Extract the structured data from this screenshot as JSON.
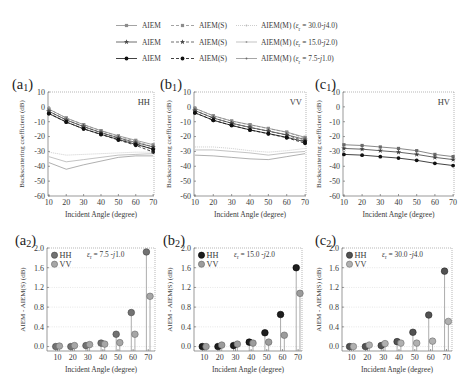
{
  "legend": {
    "rows": [
      [
        {
          "label": "AIEM",
          "line": "solid",
          "marker": "square",
          "color": "#8c8c8c"
        },
        {
          "label": "AIEM(S)",
          "line": "dashed",
          "marker": "square",
          "color": "#8c8c8c"
        },
        {
          "label": "AIEM(M) (*ε*_r = 30.0-*j*4.0)",
          "line": "dotted",
          "marker": "dot",
          "color": "#b8b8b8"
        }
      ],
      [
        {
          "label": "AIEM",
          "line": "solid",
          "marker": "star",
          "color": "#4a4a4a"
        },
        {
          "label": "AIEM(S)",
          "line": "dashed",
          "marker": "star",
          "color": "#4a4a4a"
        },
        {
          "label": "AIEM(M) (*ε*_r = 15.0-*j*2.0)",
          "line": "thin",
          "marker": "dot",
          "color": "#9a9a9a"
        }
      ],
      [
        {
          "label": "AIEM",
          "line": "solid",
          "marker": "circle",
          "color": "#111111"
        },
        {
          "label": "AIEM(S)",
          "line": "dashed",
          "marker": "circle",
          "color": "#111111"
        },
        {
          "label": "AIEM(M) (*ε*_r = 7.5-*j*1.0)",
          "line": "thin",
          "marker": "dot",
          "color": "#6a6a6a"
        }
      ]
    ]
  },
  "chart_data": [
    {
      "type": "line",
      "panel_label": "(a_1)",
      "polarization_label": "HH",
      "xlabel": "Incident  Angle (degree)",
      "ylabel": "Backscattering coefficient (dB)",
      "x": [
        10,
        20,
        30,
        40,
        50,
        60,
        70
      ],
      "xlim": [
        9.5,
        70.5
      ],
      "ylim": [
        -60,
        10
      ],
      "xticks": [
        10,
        20,
        30,
        40,
        50,
        60,
        70
      ],
      "xtick_labels": [
        "10",
        "20",
        "30",
        "40",
        "50",
        "60",
        "70"
      ],
      "yticks": [
        10,
        0,
        -10,
        -20,
        -30,
        -40,
        -50,
        -60
      ],
      "ytick_labels": [
        "10",
        "0",
        "-10",
        "-20",
        "-30",
        "-40",
        "-50",
        "-60"
      ],
      "grid": false,
      "series": [
        {
          "name": "AIEM (εr = 30.0-j4.0)",
          "line": "solid",
          "marker": "square",
          "color": "#8c8c8c",
          "values": [
            -1.5,
            -7.5,
            -12.0,
            -16.0,
            -19.5,
            -22.5,
            -25.5
          ]
        },
        {
          "name": "AIEM(S) (εr = 30.0-j4.0)",
          "line": "dashed",
          "marker": "square",
          "color": "#8c8c8c",
          "values": [
            -1.5,
            -7.5,
            -12.0,
            -16.1,
            -19.8,
            -23.1,
            -27.0
          ]
        },
        {
          "name": "AIEM (εr = 15.0-j2.0)",
          "line": "solid",
          "marker": "star",
          "color": "#4a4a4a",
          "values": [
            -3.0,
            -8.8,
            -13.3,
            -17.3,
            -20.8,
            -24.0,
            -27.0
          ]
        },
        {
          "name": "AIEM(S) (εr = 15.0-j2.0)",
          "line": "dashed",
          "marker": "star",
          "color": "#4a4a4a",
          "values": [
            -3.0,
            -8.8,
            -13.3,
            -17.4,
            -21.1,
            -24.7,
            -28.6
          ]
        },
        {
          "name": "AIEM (εr = 7.5-j1.0)",
          "line": "solid",
          "marker": "circle",
          "color": "#111111",
          "values": [
            -4.5,
            -10.2,
            -14.8,
            -18.5,
            -22.0,
            -25.2,
            -28.5
          ]
        },
        {
          "name": "AIEM(S) (εr = 7.5-j1.0)",
          "line": "dashed",
          "marker": "circle",
          "color": "#111111",
          "values": [
            -4.5,
            -10.2,
            -14.8,
            -18.6,
            -22.3,
            -25.9,
            -30.4
          ]
        },
        {
          "name": "AIEM(M) (εr = 30.0-j4.0)",
          "line": "dotted",
          "marker": "none",
          "color": "#b8b8b8",
          "values": [
            -30.5,
            -32.5,
            -32.0,
            -31.5,
            -31.0,
            -30.5,
            -30.5
          ]
        },
        {
          "name": "AIEM(M) (εr = 15.0-j2.0)",
          "line": "thin",
          "marker": "none",
          "color": "#9a9a9a",
          "values": [
            -33.5,
            -37.0,
            -35.5,
            -34.0,
            -32.5,
            -32.0,
            -31.5
          ]
        },
        {
          "name": "AIEM(M) (εr = 7.5-j1.0)",
          "line": "thin",
          "marker": "none",
          "color": "#7a7a7a",
          "values": [
            -37.5,
            -42.0,
            -39.0,
            -36.5,
            -34.0,
            -33.0,
            -33.0
          ]
        }
      ]
    },
    {
      "type": "line",
      "panel_label": "(b_1)",
      "polarization_label": "VV",
      "xlabel": "Incident  Angle (degree)",
      "ylabel": "Backscattering coefficient (dB)",
      "x": [
        10,
        20,
        30,
        40,
        50,
        60,
        70
      ],
      "xlim": [
        9.5,
        70.5
      ],
      "ylim": [
        -60,
        10
      ],
      "xticks": [
        10,
        20,
        30,
        40,
        50,
        60,
        70
      ],
      "xtick_labels": [
        "10",
        "20",
        "30",
        "40",
        "50",
        "60",
        "70"
      ],
      "yticks": [
        10,
        0,
        -10,
        -20,
        -30,
        -40,
        -50,
        -60
      ],
      "ytick_labels": [
        "10",
        "0",
        "-10",
        "-20",
        "-30",
        "-40",
        "-50",
        "-60"
      ],
      "grid": false,
      "series": [
        {
          "name": "AIEM (εr = 30.0-j4.0)",
          "line": "solid",
          "marker": "square",
          "color": "#8c8c8c",
          "values": [
            -1.0,
            -6.0,
            -9.5,
            -12.0,
            -14.5,
            -17.0,
            -20.5
          ]
        },
        {
          "name": "AIEM(S) (εr = 30.0-j4.0)",
          "line": "dashed",
          "marker": "square",
          "color": "#8c8c8c",
          "values": [
            -1.0,
            -6.0,
            -9.6,
            -12.1,
            -14.6,
            -17.1,
            -21.0
          ]
        },
        {
          "name": "AIEM (εr = 15.0-j2.0)",
          "line": "solid",
          "marker": "star",
          "color": "#4a4a4a",
          "values": [
            -2.5,
            -7.5,
            -11.0,
            -13.8,
            -16.3,
            -18.8,
            -22.0
          ]
        },
        {
          "name": "AIEM(S) (εr = 15.0-j2.0)",
          "line": "dashed",
          "marker": "star",
          "color": "#4a4a4a",
          "values": [
            -2.5,
            -7.5,
            -11.1,
            -13.9,
            -16.4,
            -19.0,
            -23.1
          ]
        },
        {
          "name": "AIEM (εr = 7.5-j1.0)",
          "line": "solid",
          "marker": "circle",
          "color": "#111111",
          "values": [
            -4.0,
            -9.0,
            -12.5,
            -15.5,
            -18.0,
            -20.5,
            -23.5
          ]
        },
        {
          "name": "AIEM(S) (εr = 7.5-j1.0)",
          "line": "dashed",
          "marker": "circle",
          "color": "#111111",
          "values": [
            -4.0,
            -9.0,
            -12.5,
            -15.6,
            -18.1,
            -20.8,
            -24.5
          ]
        },
        {
          "name": "AIEM(M) (εr = 30.0-j4.0)",
          "line": "dotted",
          "marker": "none",
          "color": "#b8b8b8",
          "values": [
            -27.0,
            -27.0,
            -28.0,
            -29.5,
            -30.5,
            -29.5,
            -28.0
          ]
        },
        {
          "name": "AIEM(M) (εr = 15.0-j2.0)",
          "line": "thin",
          "marker": "none",
          "color": "#9a9a9a",
          "values": [
            -29.0,
            -29.0,
            -30.0,
            -31.0,
            -32.5,
            -31.0,
            -30.0
          ]
        },
        {
          "name": "AIEM(M) (εr = 7.5-j1.0)",
          "line": "thin",
          "marker": "none",
          "color": "#7a7a7a",
          "values": [
            -32.5,
            -33.0,
            -34.0,
            -35.0,
            -35.5,
            -33.5,
            -31.5
          ]
        }
      ]
    },
    {
      "type": "line",
      "panel_label": "(c_1)",
      "polarization_label": "HV",
      "xlabel": "Incident  Angle (degree)",
      "ylabel": "Backscattering coefficient (dB)",
      "x": [
        10,
        20,
        30,
        40,
        50,
        60,
        70
      ],
      "xlim": [
        9.5,
        70.5
      ],
      "ylim": [
        -60,
        10
      ],
      "xticks": [
        10,
        20,
        30,
        40,
        50,
        60,
        70
      ],
      "xtick_labels": [
        "10",
        "20",
        "30",
        "40",
        "50",
        "60",
        "70"
      ],
      "yticks": [
        10,
        0,
        -10,
        -20,
        -30,
        -40,
        -50,
        -60
      ],
      "ytick_labels": [
        "10",
        "0",
        "-10",
        "-20",
        "-30",
        "-40",
        "-50",
        "-60"
      ],
      "grid": false,
      "series": [
        {
          "name": "AIEM (εr = 30.0-j4.0)",
          "line": "solid",
          "marker": "square",
          "color": "#6a6a6a",
          "values": [
            -25.5,
            -26.0,
            -27.0,
            -28.0,
            -29.5,
            -32.0,
            -33.5
          ]
        },
        {
          "name": "AIEM (εr = 15.0-j2.0)",
          "line": "solid",
          "marker": "star",
          "color": "#3e3e3e",
          "values": [
            -28.0,
            -28.5,
            -29.5,
            -30.5,
            -32.0,
            -34.0,
            -35.5
          ]
        },
        {
          "name": "AIEM (εr = 7.5-j1.0)",
          "line": "solid",
          "marker": "circle",
          "color": "#111111",
          "values": [
            -32.0,
            -32.5,
            -33.5,
            -34.5,
            -36.0,
            -38.0,
            -39.5
          ]
        }
      ]
    },
    {
      "type": "stem",
      "panel_label": "(a_2)",
      "annotation": "*ε*_r = 7.5 -*j*1.0",
      "xlabel": "Incident  Angle (degree)",
      "ylabel": "AIEM - AIEM(S) (dB)",
      "x": [
        10,
        20,
        30,
        40,
        50,
        60,
        70
      ],
      "xlim": [
        3,
        74.5
      ],
      "ylim": [
        -0.09,
        2.0
      ],
      "xticks": [
        10,
        20,
        30,
        40,
        50,
        60,
        70
      ],
      "xtick_labels": [
        "10",
        "20",
        "30",
        "40",
        "50",
        "60",
        "70"
      ],
      "yticks": [
        0.0,
        0.4,
        0.8,
        1.2,
        1.6,
        2.0
      ],
      "ytick_labels": [
        "0.0",
        "0.4",
        "0.8",
        "1.2",
        "1.6",
        "2.0"
      ],
      "grid": true,
      "series": [
        {
          "name": "HH",
          "color": "#727272",
          "edge": "#444444",
          "values": [
            0.0,
            0.0,
            0.02,
            0.07,
            0.25,
            0.69,
            1.92
          ]
        },
        {
          "name": "VV",
          "color": "#a6a6a6",
          "edge": "#6a6a6a",
          "values": [
            0.01,
            0.02,
            0.04,
            0.05,
            0.08,
            0.25,
            1.02
          ]
        }
      ]
    },
    {
      "type": "stem",
      "panel_label": "(b_2)",
      "annotation": "*ε*_r = 15.0 -*j*2.0",
      "xlabel": "Incident  Angle (degree)",
      "ylabel": "AIEM - AIEM(S) (dB)",
      "x": [
        10,
        20,
        30,
        40,
        50,
        60,
        70
      ],
      "xlim": [
        3.5,
        72.5
      ],
      "ylim": [
        -0.09,
        2.0
      ],
      "xticks": [
        10,
        20,
        30,
        40,
        50,
        60,
        70
      ],
      "xtick_labels": [
        "10",
        "20",
        "30",
        "40",
        "50",
        "60",
        "70"
      ],
      "yticks": [
        0.0,
        0.4,
        0.8,
        1.2,
        1.6,
        2.0
      ],
      "ytick_labels": [
        "0.0",
        "0.4",
        "0.8",
        "1.2",
        "1.6",
        "2.0"
      ],
      "grid": true,
      "series": [
        {
          "name": "HH",
          "color": "#1e1e1e",
          "edge": "#000000",
          "values": [
            0.0,
            0.0,
            0.02,
            0.09,
            0.28,
            0.65,
            1.6
          ]
        },
        {
          "name": "VV",
          "color": "#9c9c9c",
          "edge": "#666666",
          "values": [
            0.0,
            0.03,
            0.05,
            0.07,
            0.09,
            0.23,
            1.08
          ]
        }
      ]
    },
    {
      "type": "stem",
      "panel_label": "(c_2)",
      "annotation": "*ε*_r = 30.0 -*j*4.0",
      "xlabel": "Incident  Angle (degree)",
      "ylabel": "AIEM - AIEM(S) (dB)",
      "x": [
        10,
        20,
        30,
        40,
        50,
        60,
        70
      ],
      "xlim": [
        4,
        73.5
      ],
      "ylim": [
        -0.09,
        2.0
      ],
      "xticks": [
        10,
        20,
        30,
        40,
        50,
        60,
        70
      ],
      "xtick_labels": [
        "10",
        "20",
        "30",
        "40",
        "50",
        "60",
        "70"
      ],
      "yticks": [
        0.0,
        0.4,
        0.8,
        1.2,
        1.6,
        2.0
      ],
      "ytick_labels": [
        "0.0",
        "0.4",
        "0.8",
        "1.2",
        "1.6",
        "2.0"
      ],
      "grid": true,
      "series": [
        {
          "name": "HH",
          "color": "#525252",
          "edge": "#2a2a2a",
          "values": [
            0.0,
            0.0,
            0.02,
            0.1,
            0.29,
            0.64,
            1.53
          ]
        },
        {
          "name": "VV",
          "color": "#b0b0b0",
          "edge": "#707070",
          "values": [
            0.0,
            0.03,
            0.06,
            0.07,
            0.07,
            0.11,
            0.51
          ]
        }
      ]
    }
  ]
}
